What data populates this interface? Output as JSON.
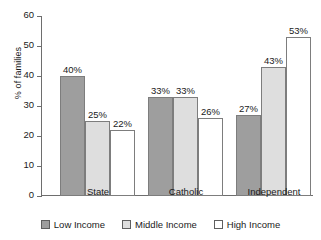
{
  "chart_data": {
    "type": "bar",
    "title": "",
    "xlabel": "",
    "ylabel": "% of families",
    "ylim": [
      0,
      60
    ],
    "yticks": [
      0,
      10,
      20,
      30,
      40,
      50,
      60
    ],
    "grid": false,
    "legend_position": "bottom",
    "categories": [
      "State",
      "Catholic",
      "Independent"
    ],
    "series": [
      {
        "name": "Low Income",
        "color": "#9e9e9e",
        "values": [
          40,
          33,
          27
        ],
        "labels": [
          "40%",
          "33%",
          "27%"
        ]
      },
      {
        "name": "Middle Income",
        "color": "#dedede",
        "values": [
          25,
          33,
          43
        ],
        "labels": [
          "25%",
          "33%",
          "43%"
        ]
      },
      {
        "name": "High Income",
        "color": "#ffffff",
        "values": [
          22,
          26,
          53
        ],
        "labels": [
          "22%",
          "26%",
          "53%"
        ]
      }
    ]
  },
  "axis": {
    "tick_labels": [
      "0",
      "10",
      "20",
      "30",
      "40",
      "50",
      "60"
    ],
    "y_title": "% of families"
  },
  "legend": {
    "items": [
      {
        "label": "Low Income"
      },
      {
        "label": "Middle Income"
      },
      {
        "label": "High Income"
      }
    ]
  }
}
